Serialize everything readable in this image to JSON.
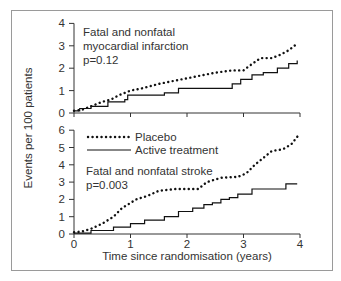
{
  "chart_data": [
    {
      "type": "line",
      "title": "Fatal and nonfatal myocardial infarction",
      "annotation": [
        "Fatal and nonfatal",
        "myocardial infarction",
        "p=0.12"
      ],
      "p_value": "p=0.12",
      "xlabel": "Time since randomisation (years)",
      "ylabel": "Events per 100 patients",
      "xlim": [
        0,
        4
      ],
      "ylim": [
        0,
        4
      ],
      "xticks": [
        0,
        1,
        2,
        3,
        4
      ],
      "yticks": [
        0,
        1,
        2,
        3,
        4
      ],
      "series": [
        {
          "name": "Placebo",
          "style": "dotted",
          "x": [
            0,
            0.15,
            0.3,
            0.5,
            0.65,
            0.8,
            1.0,
            1.2,
            1.5,
            1.8,
            2.0,
            2.3,
            2.5,
            2.8,
            3.0,
            3.1,
            3.3,
            3.5,
            3.65,
            3.8,
            3.95
          ],
          "y": [
            0.1,
            0.15,
            0.3,
            0.5,
            0.6,
            0.8,
            1.0,
            1.1,
            1.3,
            1.45,
            1.55,
            1.7,
            1.8,
            1.9,
            1.9,
            2.1,
            2.45,
            2.45,
            2.6,
            2.8,
            3.1
          ]
        },
        {
          "name": "Active treatment",
          "style": "solid-step",
          "x": [
            0,
            0.1,
            0.3,
            0.6,
            0.9,
            0.95,
            1.6,
            1.85,
            2.8,
            2.95,
            3.15,
            3.35,
            3.6,
            3.8,
            3.95
          ],
          "y": [
            0.1,
            0.2,
            0.3,
            0.5,
            0.6,
            0.8,
            0.9,
            1.1,
            1.3,
            1.5,
            1.7,
            1.8,
            2.0,
            2.2,
            2.35
          ]
        }
      ]
    },
    {
      "type": "line",
      "title": "Fatal and nonfatal stroke",
      "annotation": [
        "Fatal and nonfatal stroke",
        "p=0.003"
      ],
      "p_value": "p=0.003",
      "xlabel": "Time since randomisation (years)",
      "ylabel": "Events per 100 patients",
      "xlim": [
        0,
        4
      ],
      "ylim": [
        0,
        6
      ],
      "xticks": [
        0,
        1,
        2,
        3,
        4
      ],
      "yticks": [
        0,
        1,
        2,
        3,
        4,
        5,
        6
      ],
      "legend": [
        {
          "label": "Placebo",
          "style": "dotted"
        },
        {
          "label": "Active treatment",
          "style": "solid"
        }
      ],
      "series": [
        {
          "name": "Placebo",
          "style": "dotted",
          "x": [
            0,
            0.15,
            0.3,
            0.5,
            0.7,
            0.85,
            1.0,
            1.1,
            1.3,
            1.5,
            1.8,
            2.2,
            2.35,
            2.6,
            2.9,
            3.05,
            3.2,
            3.35,
            3.5,
            3.7,
            3.85,
            3.97
          ],
          "y": [
            0.1,
            0.15,
            0.3,
            0.6,
            1.0,
            1.5,
            1.8,
            2.0,
            2.2,
            2.5,
            2.6,
            2.6,
            3.0,
            3.25,
            3.3,
            3.5,
            4.0,
            4.4,
            4.8,
            4.9,
            5.2,
            5.7
          ]
        },
        {
          "name": "Active treatment",
          "style": "solid-step",
          "x": [
            0,
            0.3,
            0.7,
            1.0,
            1.25,
            1.6,
            1.85,
            2.1,
            2.3,
            2.45,
            2.6,
            2.75,
            2.9,
            3.15,
            3.6,
            3.75,
            3.95
          ],
          "y": [
            0.05,
            0.2,
            0.4,
            0.6,
            0.8,
            1.0,
            1.3,
            1.5,
            1.7,
            1.8,
            2.0,
            2.1,
            2.3,
            2.6,
            2.6,
            2.9,
            2.9
          ]
        }
      ]
    }
  ],
  "labels": {
    "ylabel": "Events per 100 patients",
    "xlabel": "Time since randomisation (years)",
    "top_title_line1": "Fatal and nonfatal",
    "top_title_line2": "myocardial infarction",
    "top_p": "p=0.12",
    "bottom_title": "Fatal and nonfatal stroke",
    "bottom_p": "p=0.003",
    "legend_placebo": "Placebo",
    "legend_active": "Active treatment"
  },
  "colors": {
    "line": "#111111",
    "axis": "#333333",
    "frame": "#9a9a9a",
    "text": "#333333"
  }
}
